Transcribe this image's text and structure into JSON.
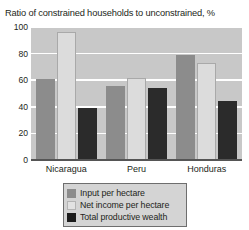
{
  "chart_data": {
    "type": "bar",
    "title": "Ratio of constrained households to unconstrained, %",
    "xlabel": "",
    "ylabel": "",
    "ylim": [
      0,
      100
    ],
    "yticks": [
      0,
      20,
      40,
      60,
      80,
      100
    ],
    "grid": true,
    "legend_position": "bottom",
    "categories": [
      "Nicaragua",
      "Peru",
      "Honduras"
    ],
    "series": [
      {
        "name": "Input per hectare",
        "color": "#8c8c8c",
        "values": [
          61,
          56,
          79
        ]
      },
      {
        "name": "Net income per hectare",
        "color": "#dcdcdc",
        "values": [
          96,
          62,
          73
        ]
      },
      {
        "name": "Total productive wealth",
        "color": "#2b2b2b",
        "values": [
          39,
          54,
          44
        ]
      }
    ]
  }
}
